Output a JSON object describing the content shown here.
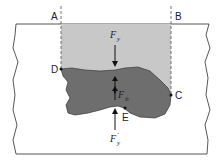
{
  "diagram": {
    "type": "buoyancy-free-body",
    "labels": {
      "A": "A",
      "B": "B",
      "C": "C",
      "D": "D",
      "E": "E"
    },
    "forces": {
      "top": {
        "symbol": "F",
        "subscript": "y",
        "direction": "down"
      },
      "buoyant": {
        "symbol": "F",
        "subscript": "b",
        "direction": "up-down"
      },
      "bottom": {
        "symbol": "F",
        "subscript": "y",
        "prime": "′",
        "direction": "up"
      }
    },
    "colors": {
      "fluid_column": "#c8c8c8",
      "body": "#6e6e6e",
      "outline": "#333333",
      "background": "#ffffff"
    }
  }
}
